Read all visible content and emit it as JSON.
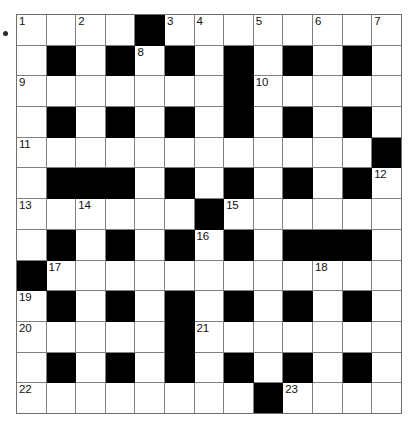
{
  "puzzle": {
    "type": "crossword-grid",
    "title": "",
    "rows": 13,
    "cols": 13,
    "colors": {
      "block": "#000000",
      "cell": "#ffffff",
      "gridline": "#808080",
      "number": "#111111",
      "background": "#ffffff"
    },
    "grid": [
      [
        "w",
        "w",
        "w",
        "w",
        "b",
        "w",
        "w",
        "w",
        "w",
        "w",
        "w",
        "w",
        "w"
      ],
      [
        "w",
        "b",
        "w",
        "b",
        "w",
        "b",
        "w",
        "b",
        "w",
        "b",
        "w",
        "b",
        "w"
      ],
      [
        "w",
        "w",
        "w",
        "w",
        "w",
        "w",
        "w",
        "b",
        "w",
        "w",
        "w",
        "w",
        "w"
      ],
      [
        "w",
        "b",
        "w",
        "b",
        "w",
        "b",
        "w",
        "b",
        "w",
        "b",
        "w",
        "b",
        "w"
      ],
      [
        "w",
        "w",
        "w",
        "w",
        "w",
        "w",
        "w",
        "w",
        "w",
        "w",
        "w",
        "w",
        "b"
      ],
      [
        "w",
        "b",
        "b",
        "b",
        "w",
        "b",
        "w",
        "b",
        "w",
        "b",
        "w",
        "b",
        "w"
      ],
      [
        "w",
        "w",
        "w",
        "w",
        "w",
        "w",
        "b",
        "w",
        "w",
        "w",
        "w",
        "w",
        "w"
      ],
      [
        "w",
        "b",
        "w",
        "b",
        "w",
        "b",
        "w",
        "b",
        "w",
        "b",
        "b",
        "b",
        "w"
      ],
      [
        "b",
        "w",
        "w",
        "w",
        "w",
        "w",
        "w",
        "w",
        "w",
        "w",
        "w",
        "w",
        "w"
      ],
      [
        "w",
        "b",
        "w",
        "b",
        "w",
        "b",
        "w",
        "b",
        "w",
        "b",
        "w",
        "b",
        "w"
      ],
      [
        "w",
        "w",
        "w",
        "w",
        "w",
        "b",
        "w",
        "w",
        "w",
        "w",
        "w",
        "w",
        "w"
      ],
      [
        "w",
        "b",
        "w",
        "b",
        "w",
        "b",
        "w",
        "b",
        "w",
        "b",
        "w",
        "b",
        "w"
      ],
      [
        "w",
        "w",
        "w",
        "w",
        "w",
        "w",
        "w",
        "w",
        "b",
        "w",
        "w",
        "w",
        "w"
      ]
    ],
    "numbers": [
      {
        "row": 0,
        "col": 0,
        "n": "1"
      },
      {
        "row": 0,
        "col": 2,
        "n": "2"
      },
      {
        "row": 0,
        "col": 5,
        "n": "3"
      },
      {
        "row": 0,
        "col": 6,
        "n": "4"
      },
      {
        "row": 0,
        "col": 8,
        "n": "5"
      },
      {
        "row": 0,
        "col": 10,
        "n": "6"
      },
      {
        "row": 0,
        "col": 12,
        "n": "7"
      },
      {
        "row": 1,
        "col": 4,
        "n": "8"
      },
      {
        "row": 2,
        "col": 0,
        "n": "9"
      },
      {
        "row": 2,
        "col": 8,
        "n": "10"
      },
      {
        "row": 4,
        "col": 0,
        "n": "11"
      },
      {
        "row": 5,
        "col": 12,
        "n": "12"
      },
      {
        "row": 6,
        "col": 0,
        "n": "13"
      },
      {
        "row": 6,
        "col": 2,
        "n": "14"
      },
      {
        "row": 6,
        "col": 7,
        "n": "15"
      },
      {
        "row": 7,
        "col": 6,
        "n": "16"
      },
      {
        "row": 8,
        "col": 1,
        "n": "17"
      },
      {
        "row": 8,
        "col": 10,
        "n": "18"
      },
      {
        "row": 9,
        "col": 0,
        "n": "19"
      },
      {
        "row": 10,
        "col": 0,
        "n": "20"
      },
      {
        "row": 10,
        "col": 6,
        "n": "21"
      },
      {
        "row": 12,
        "col": 0,
        "n": "22"
      },
      {
        "row": 12,
        "col": 9,
        "n": "23"
      }
    ],
    "entry_values": []
  }
}
